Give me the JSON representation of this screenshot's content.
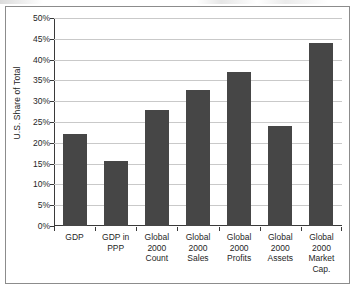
{
  "chart_data": {
    "type": "bar",
    "title": "",
    "subtitle": "",
    "xlabel": "",
    "ylabel": "U.S. Share of Total",
    "ylim": [
      0,
      50
    ],
    "y_tick_step": 5,
    "y_unit": "%",
    "grid": true,
    "legend": false,
    "legend_position": "none",
    "bar_color": "#464646",
    "gridline_color": "#c9c9c9",
    "axis_color": "#3a3a3a",
    "categories": [
      "GDP",
      "GDP in PPP",
      "Global 2000 Count",
      "Global 2000 Sales",
      "Global 2000 Profits",
      "Global 2000 Assets",
      "Global 2000 Market Cap."
    ],
    "category_lines": [
      [
        "GDP"
      ],
      [
        "GDP in",
        "PPP"
      ],
      [
        "Global",
        "2000",
        "Count"
      ],
      [
        "Global",
        "2000",
        "Sales"
      ],
      [
        "Global",
        "2000",
        "Profits"
      ],
      [
        "Global",
        "2000",
        "Assets"
      ],
      [
        "Global",
        "2000",
        "Market",
        "Cap."
      ]
    ],
    "values": [
      22.0,
      15.7,
      28.0,
      32.6,
      37.0,
      24.0,
      44.0
    ],
    "y_tick_labels": [
      "0%",
      "5%",
      "10%",
      "15%",
      "20%",
      "25%",
      "30%",
      "35%",
      "40%",
      "45%",
      "50%"
    ],
    "y_tick_values": [
      0,
      5,
      10,
      15,
      20,
      25,
      30,
      35,
      40,
      45,
      50
    ]
  }
}
